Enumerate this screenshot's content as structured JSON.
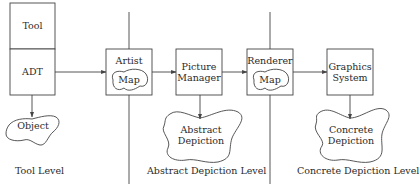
{
  "diagram": {
    "boxes": {
      "tool": "Tool",
      "adt": "ADT",
      "artist": "Artist",
      "artist_map": "Map",
      "picture_manager": [
        "Picture",
        "Manager"
      ],
      "renderer": "Renderer",
      "renderer_map": "Map",
      "graphics_system": [
        "Graphics",
        "System"
      ]
    },
    "clouds": {
      "object": "Object",
      "abstract_depiction": [
        "Abstract",
        "Depiction"
      ],
      "concrete_depiction": [
        "Concrete",
        "Depiction"
      ]
    },
    "levels": {
      "tool": "Tool Level",
      "abstract": "Abstract Depiction Level",
      "concrete": "Concrete Depiction Level"
    },
    "edges": [
      {
        "from": "ADT",
        "to": "Artist"
      },
      {
        "from": "Artist",
        "to": "Picture Manager"
      },
      {
        "from": "Picture Manager",
        "to": "Renderer"
      },
      {
        "from": "Renderer",
        "to": "Graphics System"
      },
      {
        "from": "ADT",
        "to": "Object"
      },
      {
        "from": "Picture Manager",
        "to": "Abstract Depiction"
      },
      {
        "from": "Graphics System",
        "to": "Concrete Depiction"
      }
    ]
  }
}
